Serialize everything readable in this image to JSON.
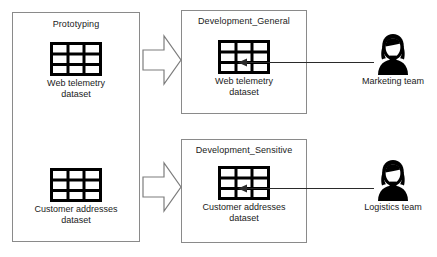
{
  "diagram": {
    "type": "flow-diagram",
    "background_color": "#ffffff",
    "stroke_color": "#8a8a8a",
    "icon_color": "#000000",
    "text_color": "#1a1a1a"
  },
  "zones": [
    {
      "id": "prototyping",
      "title": "Prototyping"
    },
    {
      "id": "development_general",
      "title": "Development_General"
    },
    {
      "id": "development_sensitive",
      "title": "Development_Sensitive"
    }
  ],
  "datasets": [
    {
      "id": "proto-web-telemetry",
      "icon": "table-grid-icon",
      "caption_line1": "Web telemetry",
      "caption_line2": "dataset"
    },
    {
      "id": "proto-customer-addresses",
      "icon": "table-grid-icon",
      "caption_line1": "Customer addresses",
      "caption_line2": "dataset"
    },
    {
      "id": "general-web-telemetry",
      "icon": "table-grid-icon",
      "caption_line1": "Web telemetry",
      "caption_line2": "dataset"
    },
    {
      "id": "sensitive-customer-addresses",
      "icon": "table-grid-icon",
      "caption_line1": "Customer addresses",
      "caption_line2": "dataset"
    }
  ],
  "actors": [
    {
      "id": "marketing",
      "icon": "person-icon",
      "label": "Marketing team"
    },
    {
      "id": "logistics",
      "icon": "person-icon",
      "label": "Logistics team"
    }
  ],
  "connectors": [
    {
      "id": "promote-telemetry",
      "style": "block-arrow",
      "direction": "right"
    },
    {
      "id": "promote-addresses",
      "style": "block-arrow",
      "direction": "right"
    },
    {
      "id": "marketing-access",
      "style": "thin-arrow",
      "direction": "left"
    },
    {
      "id": "logistics-access",
      "style": "thin-arrow",
      "direction": "left"
    }
  ]
}
